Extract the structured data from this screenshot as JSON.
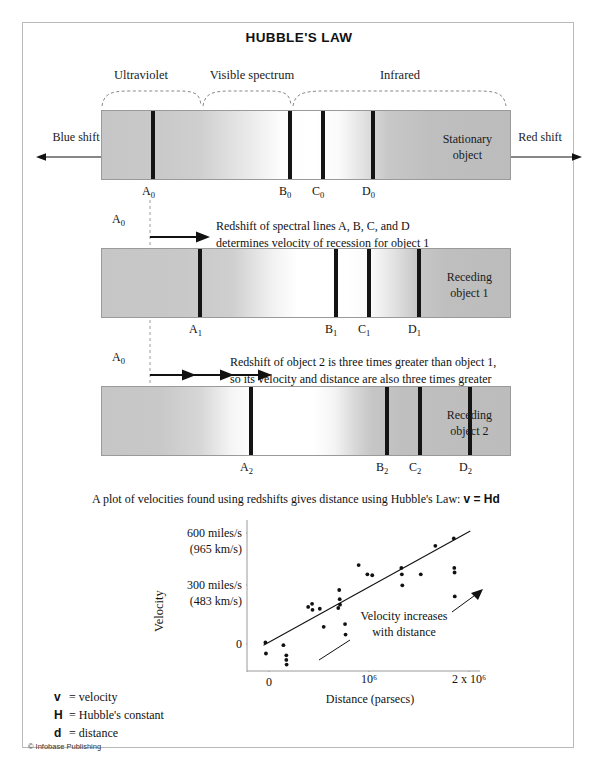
{
  "title": "HUBBLE'S LAW",
  "bands": [
    {
      "label": "Ultraviolet"
    },
    {
      "label": "Visible spectrum"
    },
    {
      "label": "Infrared"
    }
  ],
  "shift": {
    "blue_label": "Blue shift",
    "red_label": "Red shift"
  },
  "spectra": [
    {
      "object_label_line1": "Stationary",
      "object_label_line2": "object",
      "ticks": [
        "A",
        "B",
        "C",
        "D"
      ],
      "subscript": "0"
    },
    {
      "object_label_line1": "Receding",
      "object_label_line2": "object 1",
      "ticks": [
        "A",
        "B",
        "C",
        "D"
      ],
      "subscript": "1"
    },
    {
      "object_label_line1": "Receding",
      "object_label_line2": "object 2",
      "ticks": [
        "A",
        "B",
        "C",
        "D"
      ],
      "subscript": "2"
    }
  ],
  "reference_marker": "A",
  "reference_marker_sub": "0",
  "notes": {
    "note1_line1": "Redshift of spectral lines A, B, C, and D",
    "note1_line2": "determines velocity of recession for object 1",
    "note2_line1": "Redshift of object 2 is three times greater than object 1,",
    "note2_line2": "so its velocity and distance are also three times greater"
  },
  "plot_caption": {
    "text": "A plot of velocities found using redshifts gives distance using Hubble's Law: ",
    "formula": "v = Hd"
  },
  "key": [
    {
      "symbol": "v",
      "eq": "=",
      "text": "velocity"
    },
    {
      "symbol": "H",
      "eq": "=",
      "text": "Hubble's constant"
    },
    {
      "symbol": "d",
      "eq": "=",
      "text": "distance"
    }
  ],
  "credit": "© Infobase Publishing",
  "chart_data": {
    "type": "scatter",
    "title": "",
    "xlabel": "Distance (parsecs)",
    "ylabel": "Velocity",
    "xticks": [
      "0",
      "10⁶",
      "2 x 10⁶"
    ],
    "xtick_values": [
      0,
      1000000,
      2000000
    ],
    "yticks": [
      "600 miles/s\n(965 km/s)",
      "300 miles/s\n(483 km/s)",
      "0"
    ],
    "ytick_labels": [
      {
        "primary": "600 miles/s",
        "secondary": "(965 km/s)",
        "value": 600
      },
      {
        "primary": "300 miles/s",
        "secondary": "(483 km/s)",
        "value": 300
      },
      {
        "primary": "0",
        "secondary": "",
        "value": 0
      }
    ],
    "xlim": [
      -150000,
      2250000
    ],
    "ylim": [
      -120,
      700
    ],
    "grid": false,
    "legend": null,
    "annotation": {
      "line1": "Velocity increases",
      "line2": "with distance"
    },
    "trendline": {
      "x0": 20000,
      "y0": 20,
      "x1": 2150000,
      "y1": 640
    },
    "points": [
      {
        "x": 40000,
        "y": 35
      },
      {
        "x": 45000,
        "y": -25
      },
      {
        "x": 225000,
        "y": 20
      },
      {
        "x": 255000,
        "y": -35
      },
      {
        "x": 255000,
        "y": -60
      },
      {
        "x": 258000,
        "y": -85
      },
      {
        "x": 480000,
        "y": 228
      },
      {
        "x": 520000,
        "y": 245
      },
      {
        "x": 525000,
        "y": 212
      },
      {
        "x": 600000,
        "y": 218
      },
      {
        "x": 640000,
        "y": 120
      },
      {
        "x": 790000,
        "y": 222
      },
      {
        "x": 800000,
        "y": 320
      },
      {
        "x": 805000,
        "y": 270
      },
      {
        "x": 808000,
        "y": 240
      },
      {
        "x": 860000,
        "y": 135
      },
      {
        "x": 865000,
        "y": 78
      },
      {
        "x": 1000000,
        "y": 455
      },
      {
        "x": 1090000,
        "y": 405
      },
      {
        "x": 1140000,
        "y": 400
      },
      {
        "x": 1440000,
        "y": 440
      },
      {
        "x": 1445000,
        "y": 405
      },
      {
        "x": 1450000,
        "y": 345
      },
      {
        "x": 1640000,
        "y": 405
      },
      {
        "x": 1790000,
        "y": 560
      },
      {
        "x": 1980000,
        "y": 600
      },
      {
        "x": 1985000,
        "y": 440
      },
      {
        "x": 1988000,
        "y": 415
      },
      {
        "x": 1990000,
        "y": 285
      }
    ]
  }
}
